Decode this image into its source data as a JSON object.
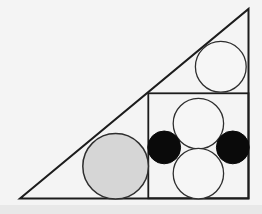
{
  "figure": {
    "kind": "geometry-diagram",
    "canvas": {
      "width": 262,
      "height": 214,
      "background": "#f4f4f4"
    },
    "colors": {
      "line": "#1c1c1c",
      "circle_outline": "#2e2e2e",
      "white_fill": "#f6f6f6",
      "black_fill": "#0a0a0a",
      "gray_fill": "#d6d6d6",
      "bottom_band": "#e8e8e8"
    },
    "bottom_band": {
      "x": 0,
      "y": 205,
      "width": 262,
      "height": 9
    },
    "triangle": {
      "points": "20,198.5 248.5,198.5 248.5,9",
      "stroke_width": 2
    },
    "square": {
      "x": 148.3,
      "y": 93.3,
      "width": 100.2,
      "height": 105,
      "stroke_width": 1.8
    },
    "circles": [
      {
        "id": "gray-circle",
        "cx": 115.6,
        "cy": 166.3,
        "r": 32.8,
        "fill": "gray_fill",
        "stroke": "circle_outline",
        "stroke_width": 1.5
      },
      {
        "id": "corner-white-circle",
        "cx": 220.8,
        "cy": 66.8,
        "r": 25.4,
        "fill": "white_fill",
        "stroke": "circle_outline",
        "stroke_width": 1.3
      },
      {
        "id": "top-white-circle",
        "cx": 198.4,
        "cy": 123.6,
        "r": 25.2,
        "fill": "white_fill",
        "stroke": "circle_outline",
        "stroke_width": 1.3
      },
      {
        "id": "bottom-white-circle",
        "cx": 198.4,
        "cy": 173.6,
        "r": 25.2,
        "fill": "white_fill",
        "stroke": "circle_outline",
        "stroke_width": 1.3
      },
      {
        "id": "left-black-circle",
        "cx": 164.2,
        "cy": 147.4,
        "r": 16.4,
        "fill": "black_fill",
        "stroke": "black_fill",
        "stroke_width": 1
      },
      {
        "id": "right-black-circle",
        "cx": 232.8,
        "cy": 147.4,
        "r": 16.4,
        "fill": "black_fill",
        "stroke": "black_fill",
        "stroke_width": 1
      }
    ]
  }
}
